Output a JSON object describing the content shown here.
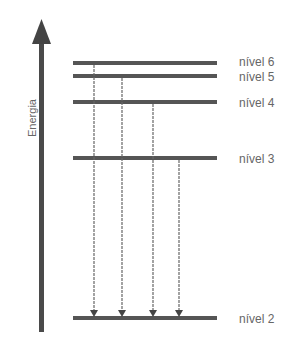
{
  "diagram": {
    "title": "",
    "axis_label": "Energia",
    "levels": [
      {
        "label": "nível 6",
        "y": 63
      },
      {
        "label": "nível 5",
        "y": 76
      },
      {
        "label": "nível 4",
        "y": 102
      },
      {
        "label": "nível 3",
        "y": 158
      },
      {
        "label": "nível 2",
        "y": 318
      }
    ],
    "transitions": [
      {
        "from": "nível 6",
        "to": "nível 2",
        "x": 94
      },
      {
        "from": "nível 5",
        "to": "nível 2",
        "x": 122
      },
      {
        "from": "nível 4",
        "to": "nível 2",
        "x": 153
      },
      {
        "from": "nível 3",
        "to": "nível 2",
        "x": 179
      }
    ],
    "colors": {
      "line": "#555555",
      "arrow": "#444444",
      "text": "#666666"
    }
  }
}
